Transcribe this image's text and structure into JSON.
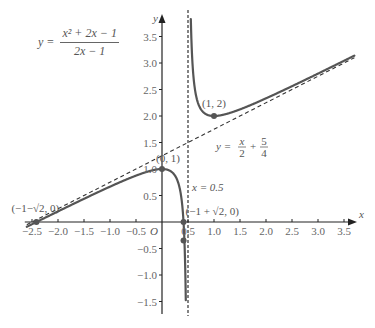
{
  "chart_data": {
    "type": "line",
    "title": "",
    "function_label": {
      "lhs": "y =",
      "numerator": "x² + 2x − 1",
      "denominator": "2x − 1"
    },
    "xlabel": "x",
    "ylabel": "y",
    "origin_label": "O",
    "xlim": [
      -2.6,
      3.7
    ],
    "ylim": [
      -1.75,
      3.7
    ],
    "grid": false,
    "x_ticks": [
      -2.5,
      -2.0,
      -1.5,
      -1.0,
      -0.5,
      0.5,
      1.0,
      1.5,
      2.0,
      2.5,
      3.0,
      3.5
    ],
    "x_tick_labels": [
      "−2.5",
      "−2.0",
      "−1.5",
      "−1.0",
      "−0.5",
      "0.5",
      "1.0",
      "1.5",
      "2.0",
      "2.5",
      "3.0",
      "3.5"
    ],
    "y_ticks": [
      -1.5,
      -1.0,
      -0.5,
      0.5,
      1.0,
      1.5,
      2.0,
      2.5,
      3.0,
      3.5
    ],
    "y_tick_labels": [
      "−1.5",
      "−1.0",
      "−0.5",
      "0.5",
      "1.0",
      "1.5",
      "2.0",
      "2.5",
      "3.0",
      "3.5"
    ],
    "series": [
      {
        "name": "y = (x² + 2x − 1)/(2x − 1)",
        "kind": "function",
        "expression": "(x*x + 2*x - 1)/(2*x - 1)",
        "color": "#555555",
        "style": "solid"
      },
      {
        "name": "y = x/2 + 5/4",
        "kind": "oblique_asymptote",
        "expression": "x/2 + 5/4",
        "color": "#333333",
        "style": "dashed"
      },
      {
        "name": "x = 0.5",
        "kind": "vertical_asymptote",
        "x": 0.5,
        "color": "#333333",
        "style": "dashed"
      }
    ],
    "points": [
      {
        "x": 0,
        "y": 1,
        "label": "(0, 1)"
      },
      {
        "x": 1,
        "y": 2,
        "label": "(1, 2)"
      },
      {
        "x": -2.4142,
        "y": 0,
        "label": "(−1−√2, 0)"
      },
      {
        "x": 0.4142,
        "y": 0,
        "label": "(−1 + √2, 0)"
      },
      {
        "x": 0.4142,
        "y": -0.35,
        "label": ""
      }
    ],
    "annotations": [
      {
        "text": "y = x/2 + 5/4",
        "near": "oblique asymptote",
        "lhs": "y =",
        "frac1": [
          "x",
          "2"
        ],
        "plus": "+",
        "frac2": [
          "5",
          "4"
        ]
      },
      {
        "text": "x = 0.5",
        "near": "vertical asymptote"
      }
    ],
    "colors": {
      "curve": "#555555",
      "axis": "#222222",
      "text": "#666666",
      "point": "#555555"
    }
  }
}
